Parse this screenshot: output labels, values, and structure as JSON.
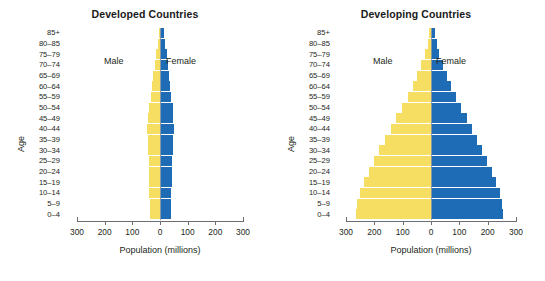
{
  "figure": {
    "caption_fragment": ""
  },
  "colors": {
    "male": "#f5de62",
    "female": "#1e6cb5",
    "axis": "#6d6e70",
    "center_line": "#8a98a5",
    "text": "#231f20",
    "background": "#ffffff"
  },
  "labels": {
    "age_axis_title": "Age",
    "x_axis_title": "Population (millions)",
    "male": "Male",
    "female": "Female"
  },
  "axis": {
    "x_ticks": [
      "300",
      "200",
      "100",
      "0",
      "100",
      "200",
      "300"
    ],
    "x_tick_values": [
      -300,
      -200,
      -100,
      0,
      100,
      200,
      300
    ],
    "x_min": -300,
    "x_max": 300
  },
  "age_groups": [
    "85+",
    "80–85",
    "75–79",
    "70–74",
    "65–69",
    "60–64",
    "55–59",
    "50–54",
    "45–49",
    "40–44",
    "35–39",
    "30–34",
    "25–29",
    "20–24",
    "15–19",
    "10–14",
    "5–9",
    "0–4"
  ],
  "chart_data": [
    {
      "type": "bar",
      "subtype": "population-pyramid",
      "title": "Developed Countries",
      "xlabel": "Population (millions)",
      "ylabel": "Age",
      "xlim": [
        -300,
        300
      ],
      "xticks": [
        -300,
        -200,
        -100,
        0,
        100,
        200,
        300
      ],
      "xticklabels": [
        "300",
        "200",
        "100",
        "0",
        "100",
        "200",
        "300"
      ],
      "grid": false,
      "legend": [
        "Male",
        "Female"
      ],
      "legend_position": "inside-top",
      "categories": [
        "85+",
        "80–85",
        "75–79",
        "70–74",
        "65–69",
        "60–64",
        "55–59",
        "50–54",
        "45–49",
        "40–44",
        "35–39",
        "30–34",
        "25–29",
        "20–24",
        "15–19",
        "10–14",
        "5–9",
        "0–4"
      ],
      "series": [
        {
          "name": "Male",
          "color": "#f5de62",
          "side": "left",
          "values": [
            4,
            8,
            13,
            19,
            25,
            29,
            34,
            40,
            44,
            46,
            45,
            43,
            41,
            40,
            39,
            38,
            37,
            36
          ]
        },
        {
          "name": "Female",
          "color": "#1e6cb5",
          "side": "right",
          "values": [
            10,
            15,
            21,
            26,
            30,
            33,
            37,
            42,
            45,
            46,
            45,
            43,
            41,
            39,
            38,
            37,
            36,
            35
          ]
        }
      ]
    },
    {
      "type": "bar",
      "subtype": "population-pyramid",
      "title": "Developing Countries",
      "xlabel": "Population (millions)",
      "ylabel": "Age",
      "xlim": [
        -300,
        300
      ],
      "xticks": [
        -300,
        -200,
        -100,
        0,
        100,
        200,
        300
      ],
      "xticklabels": [
        "300",
        "200",
        "100",
        "0",
        "100",
        "200",
        "300"
      ],
      "grid": false,
      "legend": [
        "Male",
        "Female"
      ],
      "legend_position": "inside-top",
      "categories": [
        "85+",
        "80–85",
        "75–79",
        "70–74",
        "65–69",
        "60–64",
        "55–59",
        "50–54",
        "45–49",
        "40–44",
        "35–39",
        "30–34",
        "25–29",
        "20–24",
        "15–19",
        "10–14",
        "5–9",
        "0–4"
      ],
      "series": [
        {
          "name": "Male",
          "color": "#f5de62",
          "side": "left",
          "values": [
            6,
            12,
            22,
            34,
            48,
            64,
            82,
            102,
            122,
            142,
            162,
            182,
            200,
            218,
            236,
            252,
            262,
            265
          ]
        },
        {
          "name": "Female",
          "color": "#1e6cb5",
          "side": "right",
          "values": [
            9,
            16,
            26,
            38,
            52,
            68,
            86,
            104,
            122,
            140,
            158,
            176,
            194,
            210,
            226,
            240,
            248,
            250
          ]
        }
      ]
    }
  ]
}
